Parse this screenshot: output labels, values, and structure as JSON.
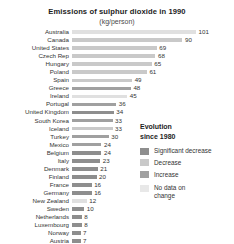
{
  "chart_data": {
    "type": "bar",
    "title": "Emissions of sulphur dioxide in 1990",
    "subtitle": "(kg/person)",
    "xlabel": "",
    "ylabel": "",
    "orientation": "horizontal",
    "grid": false,
    "xlim": [
      0,
      101
    ],
    "legend_position": "right",
    "categories": [
      "Australia",
      "Canada",
      "United States",
      "Czech Rep",
      "Hungary",
      "Poland",
      "Spain",
      "Greece",
      "Ireland",
      "Portugal",
      "United Kingdom",
      "South Korea",
      "Iceland",
      "Turkey",
      "Mexico",
      "Belgium",
      "Italy",
      "Denmark",
      "Finland",
      "France",
      "Germany",
      "New Zealand",
      "Sweden",
      "Netherlands",
      "Luxembourg",
      "Norway",
      "Austria"
    ],
    "values": [
      101,
      90,
      69,
      68,
      65,
      61,
      49,
      48,
      45,
      36,
      34,
      33,
      33,
      30,
      24,
      24,
      23,
      21,
      20,
      16,
      16,
      12,
      10,
      8,
      8,
      7,
      7
    ],
    "categories_series": [
      {
        "label": "Australia",
        "value": 101,
        "evolution": "nodata"
      },
      {
        "label": "Canada",
        "value": 90,
        "evolution": "decrease"
      },
      {
        "label": "United States",
        "value": 69,
        "evolution": "decrease"
      },
      {
        "label": "Czech Rep",
        "value": 68,
        "evolution": "decrease"
      },
      {
        "label": "Hungary",
        "value": 65,
        "evolution": "decrease"
      },
      {
        "label": "Poland",
        "value": 61,
        "evolution": "decrease"
      },
      {
        "label": "Spain",
        "value": 49,
        "evolution": "decrease"
      },
      {
        "label": "Greece",
        "value": 48,
        "evolution": "increase"
      },
      {
        "label": "Ireland",
        "value": 45,
        "evolution": "nodata"
      },
      {
        "label": "Portugal",
        "value": 36,
        "evolution": "increase"
      },
      {
        "label": "United Kingdom",
        "value": 34,
        "evolution": "sig-decrease"
      },
      {
        "label": "South Korea",
        "value": 33,
        "evolution": "increase"
      },
      {
        "label": "Iceland",
        "value": 33,
        "evolution": "decrease"
      },
      {
        "label": "Turkey",
        "value": 30,
        "evolution": "increase"
      },
      {
        "label": "Mexico",
        "value": 24,
        "evolution": "increase"
      },
      {
        "label": "Belgium",
        "value": 24,
        "evolution": "sig-decrease"
      },
      {
        "label": "Italy",
        "value": 23,
        "evolution": "sig-decrease"
      },
      {
        "label": "Denmark",
        "value": 21,
        "evolution": "sig-decrease"
      },
      {
        "label": "Finland",
        "value": 20,
        "evolution": "sig-decrease"
      },
      {
        "label": "France",
        "value": 16,
        "evolution": "sig-decrease"
      },
      {
        "label": "Germany",
        "value": 16,
        "evolution": "sig-decrease"
      },
      {
        "label": "New Zealand",
        "value": 12,
        "evolution": "nodata"
      },
      {
        "label": "Sweden",
        "value": 10,
        "evolution": "sig-decrease"
      },
      {
        "label": "Netherlands",
        "value": 8,
        "evolution": "sig-decrease"
      },
      {
        "label": "Luxembourg",
        "value": 8,
        "evolution": "sig-decrease"
      },
      {
        "label": "Norway",
        "value": 7,
        "evolution": "sig-decrease"
      },
      {
        "label": "Austria",
        "value": 7,
        "evolution": "sig-decrease"
      }
    ],
    "legend": {
      "title_line1": "Evolution",
      "title_line2": "since 1980",
      "entries": [
        {
          "key": "sig-decrease",
          "label": "Significant decrease",
          "color": "#8e8e8e"
        },
        {
          "key": "decrease",
          "label": "Decrease",
          "color": "#c9c9c9"
        },
        {
          "key": "increase",
          "label": "Increase",
          "color": "#a0a0a0"
        },
        {
          "key": "nodata",
          "label": "No data on\nchange",
          "color": "#e8e8e8"
        }
      ]
    }
  }
}
